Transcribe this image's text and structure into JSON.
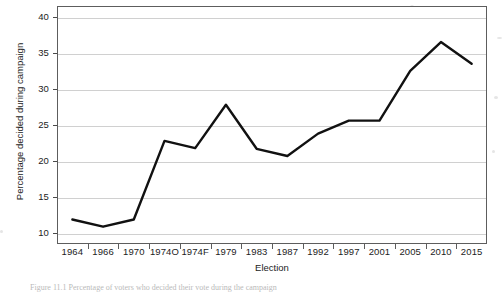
{
  "chart_data": {
    "type": "line",
    "title": "",
    "xlabel": "Election",
    "ylabel": "Percentage decided during campaign",
    "categories": [
      "1964",
      "1966",
      "1970",
      "1974O",
      "1974F",
      "1979",
      "1983",
      "1987",
      "1992",
      "1997",
      "2001",
      "2005",
      "2010",
      "2015"
    ],
    "values": [
      11.9,
      10.9,
      11.9,
      22.8,
      21.8,
      27.8,
      21.7,
      20.7,
      23.8,
      25.6,
      25.6,
      32.5,
      36.5,
      33.5
    ],
    "series": [
      {
        "name": "Percentage decided during campaign",
        "values": [
          11.9,
          10.9,
          11.9,
          22.8,
          21.8,
          27.8,
          21.7,
          20.7,
          23.8,
          25.6,
          25.6,
          32.5,
          36.5,
          33.5
        ]
      }
    ],
    "ylim": [
      8.5,
      41.5
    ],
    "yticks": [
      10,
      15,
      20,
      25,
      30,
      35,
      40
    ],
    "ytick_labels": [
      "10",
      "15",
      "20",
      "25",
      "30",
      "35",
      "40"
    ],
    "grid": "horizontal",
    "legend": "none",
    "line_color": "#111111",
    "grid_color": "#d0d0d0",
    "frame_color": "#5d5d5d",
    "background": "#ffffff"
  },
  "caption": {
    "text": "Figure 11.1   Percentage of voters who decided their vote during the campaign",
    "note": "clipped at page edge"
  }
}
